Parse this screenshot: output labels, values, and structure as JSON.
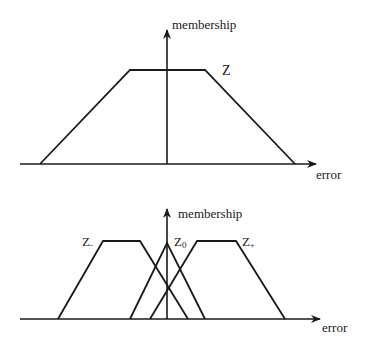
{
  "diagram": {
    "type": "fuzzy-membership-functions",
    "colors": {
      "stroke": "#1a1a1a",
      "background": "#ffffff"
    },
    "top_panel": {
      "y_axis_label": "membership",
      "x_axis_label": "error",
      "sets": [
        {
          "name": "Z",
          "label": "Z",
          "shape": "trapezoid",
          "points": [
            [
              40,
              164
            ],
            [
              130,
              70
            ],
            [
              205,
              70
            ],
            [
              295,
              164
            ]
          ]
        }
      ]
    },
    "bottom_panel": {
      "y_axis_label": "membership",
      "x_axis_label": "error",
      "sets": [
        {
          "name": "Z-",
          "label_main": "Z",
          "label_sub": "-",
          "shape": "trapezoid",
          "points": [
            [
              58,
              319
            ],
            [
              103,
              241
            ],
            [
              140,
              241
            ],
            [
              188,
              319
            ]
          ]
        },
        {
          "name": "Z0",
          "label_main": "Z",
          "label_sub": "0",
          "shape": "triangle",
          "points": [
            [
              130,
              319
            ],
            [
              167,
              243
            ],
            [
              205,
              319
            ]
          ]
        },
        {
          "name": "Z+",
          "label_main": "Z",
          "label_sub": "+",
          "shape": "trapezoid",
          "points": [
            [
              150,
              319
            ],
            [
              197,
              241
            ],
            [
              236,
              241
            ],
            [
              285,
              319
            ]
          ]
        }
      ]
    }
  }
}
